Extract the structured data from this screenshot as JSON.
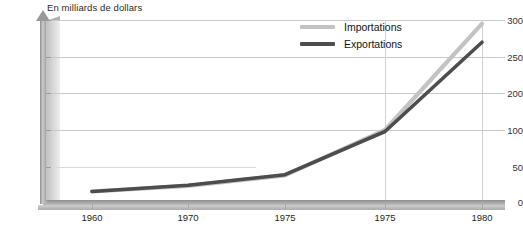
{
  "chart_data": {
    "type": "line",
    "title": "En milliards de dollars",
    "xlabel": "",
    "ylabel": "En milliards de dollars",
    "grid": true,
    "legend_position": "top-right",
    "categories": [
      "1960",
      "1970",
      "1975",
      "1975",
      "1980"
    ],
    "x_tick_labels": [
      "1960",
      "1970",
      "1975",
      "1975",
      "1980"
    ],
    "y_tick_labels": [
      "300",
      "250",
      "200",
      "100",
      "50",
      "0"
    ],
    "ylim": [
      0,
      300
    ],
    "series": [
      {
        "name": "Importations",
        "color": "#c3c3c3",
        "values": [
          15,
          23,
          38,
          100,
          295
        ]
      },
      {
        "name": "Exportations",
        "color": "#4d4d4d",
        "values": [
          15,
          24,
          39,
          98,
          270
        ]
      }
    ]
  },
  "axis": {
    "title": "En milliards de dollars",
    "y_ticks": [
      {
        "label": "300",
        "y": 20
      },
      {
        "label": "250",
        "y": 57
      },
      {
        "label": "200",
        "y": 93
      },
      {
        "label": "100",
        "y": 130
      },
      {
        "label": "50",
        "y": 167
      },
      {
        "label": "0",
        "y": 202
      }
    ],
    "x_ticks": [
      {
        "label": "1960",
        "x": 92
      },
      {
        "label": "1970",
        "x": 188
      },
      {
        "label": "1975",
        "x": 285
      },
      {
        "label": "1975",
        "x": 385
      },
      {
        "label": "1980",
        "x": 482
      }
    ]
  },
  "legend": {
    "items": [
      {
        "label": "Importations",
        "color": "#c3c3c3"
      },
      {
        "label": "Exportations",
        "color": "#4d4d4d"
      }
    ]
  },
  "colors": {
    "importations": "#c3c3c3",
    "exportations": "#4d4d4d",
    "gridline": "#c9c9c9",
    "axis": "#9a9a9a",
    "text": "#1f1f1f"
  }
}
